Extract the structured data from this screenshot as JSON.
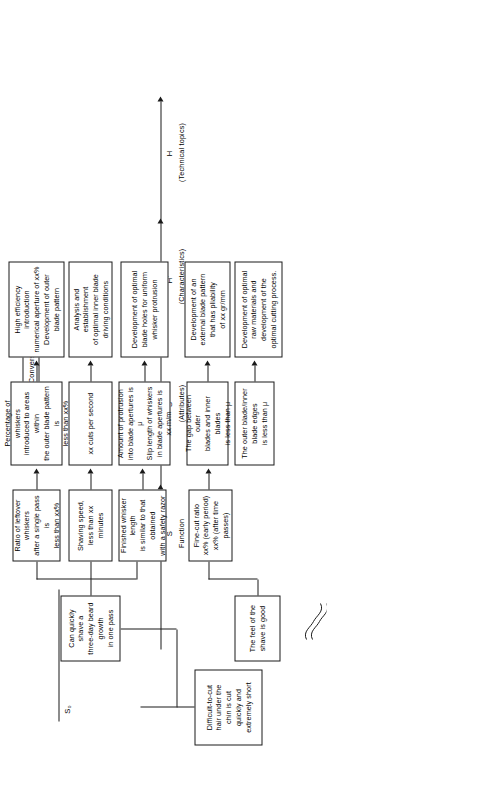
{
  "diagram": {
    "title": "Wet Shaver S-H Conversion",
    "orientation": "rotated-90-ccw",
    "stages": [
      {
        "key": "S0",
        "symbol": "S₀",
        "name": ""
      },
      {
        "key": "S",
        "symbol": "S",
        "name": "Function"
      },
      {
        "key": "S1",
        "symbol": "S’",
        "name": "(Attributes)"
      },
      {
        "key": "H1",
        "symbol": "H’",
        "name": "(Characteristics)"
      },
      {
        "key": "H",
        "symbol": "H",
        "name": "(Technical topics)"
      }
    ],
    "nodes": {
      "s0": {
        "lines": [
          "Difficult-to-cut",
          "hair under the",
          "chin is cut",
          "quickly and",
          "extremely short"
        ]
      },
      "s": [
        {
          "lines": [
            "Can quickly shave a",
            "three-day beard growth",
            "in one pass"
          ]
        },
        {
          "lines": [
            "The feel of the",
            "shave is good"
          ]
        }
      ],
      "sprime": [
        {
          "lines": [
            "Ratio of leftover whiskers",
            "after a single pass is",
            "less than xx%"
          ]
        },
        {
          "lines": [
            "Shaving speed,",
            "less than xx minutes"
          ]
        },
        {
          "lines": [
            "Finished whisker length",
            "is similar to that obtained",
            "with a safety razor"
          ]
        },
        {
          "lines": [
            "Fine-cut ratio",
            "xx% (early period)",
            "xx% (after time passes)"
          ]
        }
      ],
      "hprime": [
        {
          "lines": [
            "Percentage of whiskers",
            "introduced to areas within",
            "the outer blade pattern is",
            "less than xx%"
          ]
        },
        {
          "lines": [
            "xx cuts per second"
          ]
        },
        {
          "lines": [
            "Amount of protrusion",
            "into blade apertures is μ",
            "Slip length of whiskers",
            "in blade apertures is xx m/m"
          ]
        },
        {
          "lines": [
            "The gap between outer",
            "blades and inner blades",
            "is less than μ"
          ]
        },
        {
          "lines": [
            "The outer blade/inner",
            "blade edges",
            "is less than μ"
          ]
        }
      ],
      "h": [
        {
          "lines": [
            "High efficiency introduction",
            "numerical aperture of xx%",
            "Development of outer",
            "blade pattern"
          ]
        },
        {
          "lines": [
            "Analysis and establishment",
            "of optimal inner blade",
            "driving conditions"
          ]
        },
        {
          "lines": [
            "Development of optimal",
            "blade holes for uniform",
            "whisker protrusion"
          ]
        },
        {
          "lines": [
            "Development of an",
            "external blade pattern",
            "that has pliability",
            "of xx gr/mm"
          ]
        },
        {
          "lines": [
            "Development of optimal",
            "raw materials and",
            "development of the",
            "optimal cutting process."
          ]
        }
      ]
    }
  }
}
